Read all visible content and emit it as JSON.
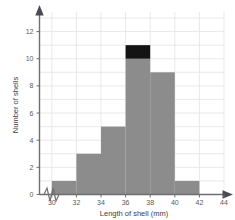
{
  "chart_data": {
    "type": "bar",
    "title": "",
    "xlabel": "Length of shell (mm)",
    "ylabel": "Number of shells",
    "xlim": [
      29,
      44
    ],
    "ylim": [
      0,
      13
    ],
    "grid": true,
    "legend": "none",
    "axis_break": true,
    "axis_break_axis": "x",
    "bin_width": 2,
    "xticks": [
      "30",
      "32",
      "34",
      "36",
      "38",
      "40",
      "42",
      "44"
    ],
    "xtick_values": [
      30,
      32,
      34,
      36,
      38,
      40,
      42,
      44
    ],
    "yticks": [
      "0",
      "2",
      "4",
      "6",
      "8",
      "10",
      "12"
    ],
    "ytick_values": [
      0,
      2,
      4,
      6,
      8,
      10,
      12
    ],
    "categories": [
      "30-32",
      "32-34",
      "34-36",
      "36-38",
      "38-40",
      "40-42"
    ],
    "bin_edges": [
      30,
      32,
      34,
      36,
      38,
      40,
      42
    ],
    "values": [
      1,
      3,
      5,
      11,
      9,
      1
    ],
    "series": [
      {
        "name": "Number of shells",
        "color": "#8c8c8c",
        "values": [
          1,
          3,
          5,
          10,
          9,
          1
        ]
      },
      {
        "name": "Highlighted shells",
        "color": "#141414",
        "values": [
          0,
          0,
          0,
          1,
          0,
          0
        ]
      }
    ],
    "colors": {
      "bar": "#8c8c8c",
      "bar_highlight": "#141414",
      "grid": "#e3e3e8",
      "axis": "#6e6e73",
      "text": "#5a5a5a",
      "background": "#ffffff"
    }
  }
}
